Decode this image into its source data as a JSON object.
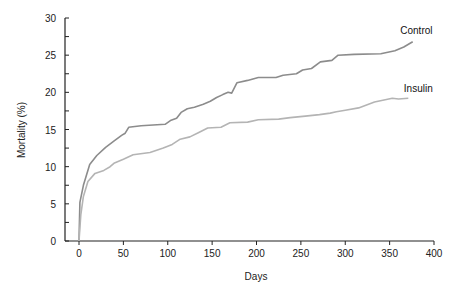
{
  "chart_data": {
    "type": "line",
    "title": "",
    "xlabel": "Days",
    "ylabel": "Mortality (%)",
    "xlim": [
      0,
      400
    ],
    "ylim": [
      0,
      30
    ],
    "x_ticks": [
      0,
      50,
      100,
      150,
      200,
      250,
      300,
      350,
      400
    ],
    "y_ticks": [
      0,
      5,
      10,
      15,
      20,
      25,
      30
    ],
    "y_minor_step": 2.5,
    "grid": false,
    "legend": "inline labels at line ends",
    "series": [
      {
        "name": "Control",
        "color": "#8c8c8c",
        "label_pos": {
          "x": 362,
          "y": 27.8
        },
        "points": [
          [
            0,
            0
          ],
          [
            1,
            5.2
          ],
          [
            5,
            7.5
          ],
          [
            12,
            10.3
          ],
          [
            20,
            11.5
          ],
          [
            30,
            12.6
          ],
          [
            40,
            13.5
          ],
          [
            48,
            14.2
          ],
          [
            52,
            14.5
          ],
          [
            56,
            15.3
          ],
          [
            70,
            15.5
          ],
          [
            97,
            15.7
          ],
          [
            103,
            16.2
          ],
          [
            110,
            16.5
          ],
          [
            115,
            17.3
          ],
          [
            122,
            17.8
          ],
          [
            130,
            18.0
          ],
          [
            140,
            18.4
          ],
          [
            148,
            18.8
          ],
          [
            155,
            19.3
          ],
          [
            162,
            19.7
          ],
          [
            168,
            20.0
          ],
          [
            172,
            19.9
          ],
          [
            178,
            21.3
          ],
          [
            190,
            21.6
          ],
          [
            202,
            22.0
          ],
          [
            222,
            22.0
          ],
          [
            230,
            22.3
          ],
          [
            245,
            22.5
          ],
          [
            252,
            23.0
          ],
          [
            262,
            23.2
          ],
          [
            272,
            24.1
          ],
          [
            285,
            24.3
          ],
          [
            292,
            25.0
          ],
          [
            310,
            25.1
          ],
          [
            340,
            25.2
          ],
          [
            356,
            25.6
          ],
          [
            366,
            26.1
          ],
          [
            376,
            26.8
          ]
        ]
      },
      {
        "name": "Insulin",
        "color": "#b4b4b4",
        "label_pos": {
          "x": 366,
          "y": 20.0
        },
        "points": [
          [
            0,
            0
          ],
          [
            2,
            3.5
          ],
          [
            5,
            6.0
          ],
          [
            10,
            8.0
          ],
          [
            18,
            9.1
          ],
          [
            28,
            9.5
          ],
          [
            35,
            10.0
          ],
          [
            40,
            10.5
          ],
          [
            50,
            11.0
          ],
          [
            61,
            11.6
          ],
          [
            80,
            11.9
          ],
          [
            95,
            12.5
          ],
          [
            105,
            13.0
          ],
          [
            114,
            13.7
          ],
          [
            125,
            14.0
          ],
          [
            135,
            14.6
          ],
          [
            145,
            15.2
          ],
          [
            160,
            15.3
          ],
          [
            170,
            15.9
          ],
          [
            190,
            16.0
          ],
          [
            202,
            16.3
          ],
          [
            225,
            16.4
          ],
          [
            238,
            16.6
          ],
          [
            255,
            16.8
          ],
          [
            271,
            17.0
          ],
          [
            283,
            17.2
          ],
          [
            290,
            17.4
          ],
          [
            300,
            17.6
          ],
          [
            315,
            17.9
          ],
          [
            333,
            18.7
          ],
          [
            345,
            19.0
          ],
          [
            353,
            19.2
          ],
          [
            360,
            19.1
          ],
          [
            371,
            19.2
          ]
        ]
      }
    ]
  }
}
